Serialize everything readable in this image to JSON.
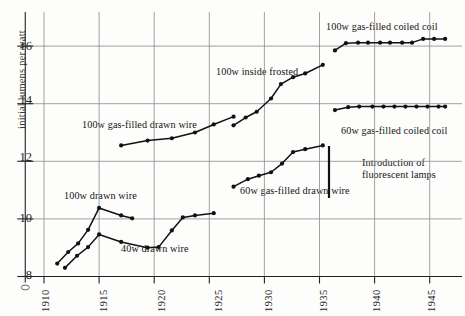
{
  "chart_data": {
    "type": "line",
    "title": "",
    "xlabel": "",
    "ylabel": "initial lumens per watt",
    "xlim": [
      1908,
      1947
    ],
    "ylim": [
      8,
      16.6
    ],
    "xticks": [
      "1910",
      "1915",
      "1920",
      "1925",
      "1930",
      "1935",
      "1940",
      "1945"
    ],
    "yticks": [
      "8",
      "10",
      "12",
      "14",
      "16"
    ],
    "grid": true,
    "legend": "inline-annotations",
    "series": [
      {
        "name": "100w drawn wire",
        "label": "100w drawn wire",
        "points": [
          [
            1911.2,
            8.45
          ],
          [
            1912.2,
            8.85
          ],
          [
            1913.1,
            9.15
          ],
          [
            1914.0,
            9.62
          ],
          [
            1915.0,
            10.38
          ],
          [
            1917.0,
            10.12
          ],
          [
            1918.0,
            10.02
          ]
        ]
      },
      {
        "name": "40w drawn wire",
        "label": "40w drawn wire",
        "points": [
          [
            1911.9,
            8.3
          ],
          [
            1913.0,
            8.72
          ],
          [
            1914.0,
            9.02
          ],
          [
            1915.0,
            9.46
          ],
          [
            1917.0,
            9.2
          ],
          [
            1919.4,
            9.0
          ],
          [
            1920.4,
            9.02
          ],
          [
            1921.6,
            9.6
          ],
          [
            1922.6,
            10.05
          ],
          [
            1923.7,
            10.12
          ],
          [
            1925.4,
            10.2
          ]
        ]
      },
      {
        "name": "100w gas-filled drawn wire",
        "label": "100w gas-filled drawn wire",
        "points": [
          [
            1917.0,
            12.55
          ],
          [
            1919.4,
            12.72
          ],
          [
            1921.6,
            12.8
          ],
          [
            1923.7,
            13.0
          ],
          [
            1925.4,
            13.28
          ],
          [
            1927.2,
            13.55
          ]
        ]
      },
      {
        "name": "100w inside frosted",
        "label": "100w inside frosted",
        "points": [
          [
            1927.2,
            13.25
          ],
          [
            1928.3,
            13.52
          ],
          [
            1929.3,
            13.72
          ],
          [
            1930.6,
            14.18
          ],
          [
            1931.5,
            14.68
          ],
          [
            1932.6,
            14.92
          ],
          [
            1933.7,
            15.05
          ],
          [
            1935.3,
            15.35
          ]
        ]
      },
      {
        "name": "60w gas-filled drawn wire",
        "label": "60w gas-filled drawn wire",
        "points": [
          [
            1927.2,
            11.12
          ],
          [
            1928.5,
            11.38
          ],
          [
            1929.5,
            11.5
          ],
          [
            1930.6,
            11.62
          ],
          [
            1931.6,
            11.92
          ],
          [
            1932.6,
            12.32
          ],
          [
            1933.7,
            12.42
          ],
          [
            1935.3,
            12.55
          ]
        ]
      },
      {
        "name": "100w gas-filled coiled coil",
        "label": "100w gas-filled coiled coil",
        "points": [
          [
            1936.4,
            15.85
          ],
          [
            1937.4,
            16.1
          ],
          [
            1938.5,
            16.12
          ],
          [
            1939.4,
            16.12
          ],
          [
            1940.5,
            16.12
          ],
          [
            1941.4,
            16.12
          ],
          [
            1942.5,
            16.12
          ],
          [
            1943.4,
            16.12
          ],
          [
            1944.4,
            16.25
          ],
          [
            1945.4,
            16.25
          ],
          [
            1946.4,
            16.25
          ]
        ]
      },
      {
        "name": "60w gas-filled coiled coil",
        "label": "60w gas-filled coiled coil",
        "points": [
          [
            1936.4,
            13.78
          ],
          [
            1937.6,
            13.88
          ],
          [
            1938.6,
            13.9
          ],
          [
            1939.8,
            13.9
          ],
          [
            1940.8,
            13.9
          ],
          [
            1941.8,
            13.9
          ],
          [
            1942.8,
            13.9
          ],
          [
            1943.8,
            13.9
          ],
          [
            1944.8,
            13.9
          ],
          [
            1945.8,
            13.9
          ],
          [
            1946.4,
            13.9
          ]
        ]
      }
    ],
    "annotations": [
      {
        "name": "introduction-of-fluorescent-lamps",
        "text": "Introduction of fluorescent lamps",
        "line1": "Introduction of",
        "line2": "fluorescent lamps",
        "x": 1936.0
      }
    ],
    "colors": {
      "line": "#111111",
      "grid": "#8a8a8a",
      "axis": "#222222",
      "text": "#141414"
    }
  }
}
